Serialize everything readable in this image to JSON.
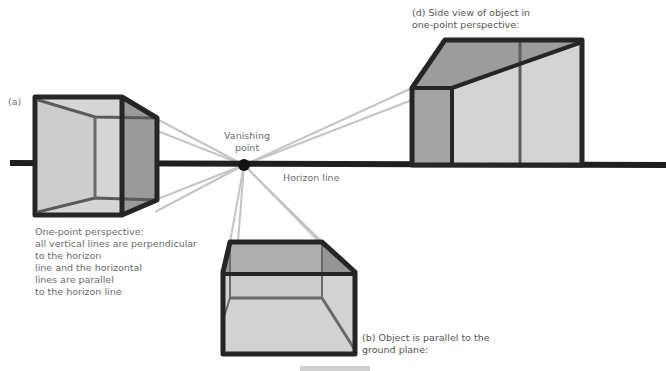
{
  "labels": {
    "a": "(a)",
    "vanishing_point": "Vanishing\npoint",
    "horizon_line": "Horizon line",
    "d": "(d) Side view of object in\none-point perspective:",
    "b": "(b) Object is parallel to the\nground plane:",
    "description": "One-point perspective:\nall vertical lines are perpendicular\nto the horizon\nline and the horizontal\nlines are parallel\nto the horizon line"
  },
  "colors": {
    "outline": "#2b2b2b",
    "face_light": "#d2d2d2",
    "face_mid": "#b9b9b9",
    "face_dark": "#8f8f8f",
    "guide_line": "#bdbdbd",
    "text": "#6b6b6b"
  },
  "geometry": {
    "vanishing_point": [
      244,
      165
    ],
    "horizon_y": 163
  }
}
